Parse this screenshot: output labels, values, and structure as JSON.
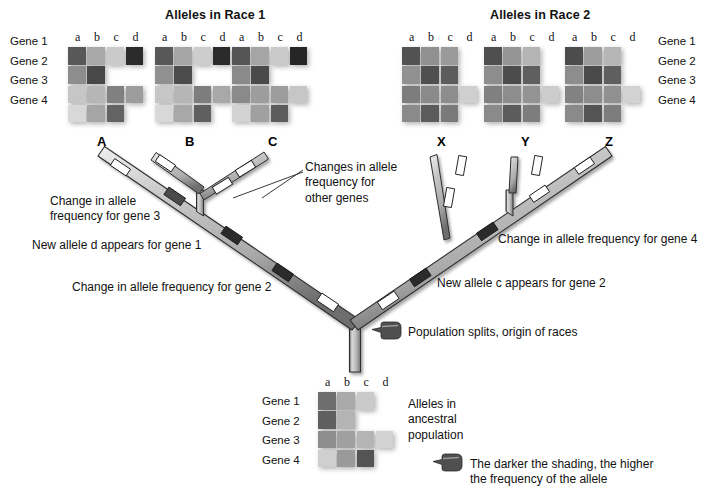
{
  "titles": {
    "race1": "Alleles in Race 1",
    "race2": "Alleles in Race 2"
  },
  "allele_columns": [
    "a",
    "b",
    "c",
    "d"
  ],
  "gene_rows": [
    "Gene 1",
    "Gene 2",
    "Gene 3",
    "Gene 4"
  ],
  "shade_legend": {
    "text": "The darker the shading, the higher\nthe frequency of the allele",
    "icon": "pointing-hand-icon"
  },
  "population_split_note": {
    "text": "Population splits, origin of races",
    "icon": "pointing-hand-icon"
  },
  "ancestral": {
    "caption": "Alleles in\nancestral\npopulation",
    "columns": [
      "a",
      "b",
      "c",
      "d"
    ],
    "rows": [
      "Gene 1",
      "Gene 2",
      "Gene 3",
      "Gene 4"
    ],
    "grid": [
      [
        "#6e6e6e",
        "#aaaaaa",
        "#cacaca",
        null
      ],
      [
        "#5f5f5f",
        "#b4b4b4",
        null,
        null
      ],
      [
        "#8d8d8d",
        "#a0a0a0",
        "#b4b4b4",
        "#d2d2d2"
      ],
      [
        "#cfcfcf",
        "#9a9a9a",
        "#545454",
        null
      ]
    ]
  },
  "race1": {
    "populations": [
      {
        "name": "A",
        "grid": [
          [
            "#585858",
            "#a8a8a8",
            "#cacaca",
            "#2b2b2b"
          ],
          [
            "#8d8d8d",
            "#484848",
            null,
            null
          ],
          [
            "#c6c6c6",
            "#b6b6b6",
            "#808080",
            "#9d9d9d"
          ],
          [
            "#d8d8d8",
            "#a5a5a5",
            "#636363",
            null
          ]
        ]
      },
      {
        "name": "B",
        "grid": [
          [
            "#585858",
            "#a5a5a5",
            "#cdcdcd",
            "#2b2b2b"
          ],
          [
            "#909090",
            "#4c4c4c",
            null,
            null
          ],
          [
            "#c6c6c6",
            "#b6b6b6",
            "#7d7d7d",
            "#a8a8a8"
          ],
          [
            "#d8d8d8",
            "#a8a8a8",
            "#5f5f5f",
            null
          ]
        ]
      },
      {
        "name": "C",
        "grid": [
          [
            "#555555",
            "#a5a5a5",
            "#cacaca",
            "#262626"
          ],
          [
            "#8a8a8a",
            "#4a4a4a",
            null,
            null
          ],
          [
            "#8a8a8a",
            "#9d9d9d",
            "#9d9d9d",
            "#c6c6c6"
          ],
          [
            "#d2d2d2",
            "#a0a0a0",
            "#5c5c5c",
            null
          ]
        ]
      }
    ]
  },
  "race2": {
    "populations": [
      {
        "name": "X",
        "grid": [
          [
            "#525252",
            "#909090",
            "#9a9a9a",
            null
          ],
          [
            "#919191",
            "#4f4f4f",
            "#5c5c5c",
            null
          ],
          [
            "#7d7d7d",
            "#8a8a8a",
            "#8d8d8d",
            "#cfcfcf"
          ],
          [
            "#8a8a8a",
            "#5c5c5c",
            "#7a7a7a",
            null
          ]
        ]
      },
      {
        "name": "Y",
        "grid": [
          [
            "#4f4f4f",
            "#959595",
            "#b4b4b4",
            null
          ],
          [
            "#8d8d8d",
            "#4c4c4c",
            "#5f5f5f",
            null
          ],
          [
            "#808080",
            "#8d8d8d",
            "#939393",
            "#cccccc"
          ],
          [
            "#8a8a8a",
            "#5c5c5c",
            "#7d7d7d",
            null
          ]
        ]
      },
      {
        "name": "Z",
        "grid": [
          [
            "#4c4c4c",
            "#9d9d9d",
            "#b6b6b6",
            null
          ],
          [
            "#8d8d8d",
            "#4a4a4a",
            "#5f5f5f",
            null
          ],
          [
            "#828282",
            "#8d8d8d",
            "#909090",
            "#d2d2d2"
          ],
          [
            "#8a8a8a",
            "#545454",
            "#7d7d7d",
            null
          ]
        ]
      }
    ]
  },
  "annotations": {
    "left": [
      {
        "id": "gene3-change",
        "text": "Change in allele\nfrequency for gene 3"
      },
      {
        "id": "gene1-new-d",
        "text": "New allele d appears for gene 1"
      },
      {
        "id": "gene2-change",
        "text": "Change in allele frequency for gene 2"
      },
      {
        "id": "other-genes",
        "text": "Changes in allele\nfrequency for\nother genes"
      }
    ],
    "right": [
      {
        "id": "gene4-change",
        "text": "Change in allele frequency for gene 4"
      },
      {
        "id": "gene2-new-c",
        "text": "New allele c appears for gene 2"
      }
    ]
  },
  "tree": {
    "tips_left": [
      "A",
      "B",
      "C"
    ],
    "tips_right": [
      "X",
      "Y",
      "Z"
    ],
    "branch_color": "#b9b9b9",
    "branch_edge": "#2e2e2e",
    "tick_light": "#ffffff",
    "tick_dark": "#2b2b2b"
  }
}
